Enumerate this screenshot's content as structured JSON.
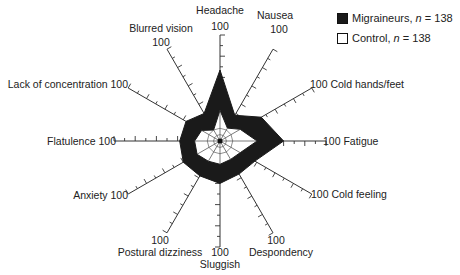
{
  "chart_data": {
    "type": "radar",
    "title": "",
    "center": [
      220,
      141
    ],
    "radius": 106,
    "max": 100,
    "tick_step": 20,
    "categories": [
      "Headache",
      "Nausea",
      "Cold hands/feet",
      "Fatigue",
      "Cold feeling",
      "Despondency",
      "Sluggish",
      "Postural dizziness",
      "Anxiety",
      "Flatulence",
      "Lack of concentration",
      "Blurred vision"
    ],
    "series": [
      {
        "name": "Migraineurs",
        "n": 138,
        "fill": "#1a1a1a",
        "values": [
          67,
          28,
          45,
          60,
          38,
          36,
          40,
          38,
          40,
          38,
          37,
          30
        ]
      },
      {
        "name": "Control",
        "n": 138,
        "fill": "#ffffff",
        "values": [
          29,
          14,
          22,
          35,
          22,
          20,
          22,
          22,
          25,
          24,
          20,
          12
        ]
      }
    ],
    "axis_end_label": "100"
  },
  "legend": {
    "items": [
      {
        "name": "Migraineurs",
        "n_label": "n",
        "n_value": "= 138"
      },
      {
        "name": "Control",
        "n_label": "n",
        "n_value": "= 138"
      }
    ]
  },
  "labels": [
    {
      "text": "Headache",
      "x": 220,
      "y": 14,
      "anchor": "middle"
    },
    {
      "text": "100",
      "x": 220,
      "y": 30,
      "anchor": "middle"
    },
    {
      "text": "Nausea",
      "x": 275,
      "y": 19,
      "anchor": "middle"
    },
    {
      "text": "100",
      "x": 279,
      "y": 33,
      "anchor": "middle"
    },
    {
      "text": "Blurred vision",
      "x": 161,
      "y": 32,
      "anchor": "middle"
    },
    {
      "text": "100",
      "x": 161,
      "y": 46,
      "anchor": "middle"
    },
    {
      "text": "100 Cold hands/feet",
      "x": 310,
      "y": 88,
      "anchor": "start"
    },
    {
      "text": "100 Fatigue",
      "x": 323,
      "y": 145,
      "anchor": "start"
    },
    {
      "text": "100 Cold feeling",
      "x": 311,
      "y": 198,
      "anchor": "start"
    },
    {
      "text": "100",
      "x": 276,
      "y": 244,
      "anchor": "middle"
    },
    {
      "text": "Despondency",
      "x": 281,
      "y": 256,
      "anchor": "middle"
    },
    {
      "text": "100",
      "x": 220,
      "y": 256,
      "anchor": "middle"
    },
    {
      "text": "Sluggish",
      "x": 220,
      "y": 268,
      "anchor": "middle"
    },
    {
      "text": "100",
      "x": 160,
      "y": 244,
      "anchor": "middle"
    },
    {
      "text": "Postural dizziness",
      "x": 160,
      "y": 256,
      "anchor": "middle"
    },
    {
      "text": "Anxiety 100",
      "x": 128,
      "y": 199,
      "anchor": "end"
    },
    {
      "text": "Flatulence 100",
      "x": 116,
      "y": 145,
      "anchor": "end"
    },
    {
      "text": "Lack of concentration 100",
      "x": 128,
      "y": 88,
      "anchor": "end"
    }
  ]
}
